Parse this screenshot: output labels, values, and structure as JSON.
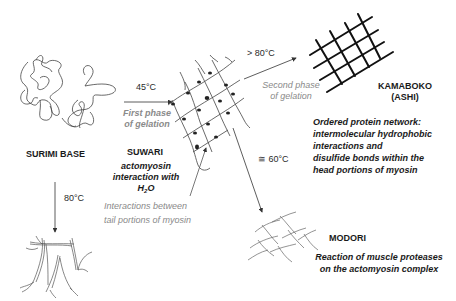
{
  "diagram": {
    "nodes": {
      "surimi_base": {
        "label": "SURIMI BASE"
      },
      "suwari": {
        "label": "SUWARI",
        "description_line1": "actomyosin",
        "description_line2": "interaction with",
        "description_h": "H",
        "description_sub": "2",
        "description_o": "O"
      },
      "kamaboko": {
        "label_line1": "KAMABOKO",
        "label_line2": "(ASHI)",
        "description": [
          "Ordered protein network:",
          "intermolecular hydrophobic",
          "interactions and",
          "disulfide bonds within the",
          "head portions of myosin"
        ]
      },
      "modori": {
        "label": "MODORI",
        "description": [
          "Reaction of muscle proteases",
          "on the  actomyosin complex"
        ]
      }
    },
    "edges": {
      "surimi_to_suwari": {
        "temperature": "45°C",
        "phase_line1": "First phase",
        "phase_line2": "of gelation"
      },
      "suwari_to_kamaboko": {
        "temperature": "> 80°C",
        "phase_line1": "Second phase",
        "phase_line2": "of gelation"
      },
      "suwari_to_modori": {
        "temperature": "≅ 60°C"
      },
      "surimi_to_fibrous": {
        "temperature": "80°C"
      },
      "tail_interactions": {
        "line1": "Interactions between",
        "line2": "tail  portions of myosin"
      }
    },
    "colors": {
      "text": "#1a1a1a",
      "gray_text": "#8a8a8a",
      "line": "#333333"
    }
  }
}
